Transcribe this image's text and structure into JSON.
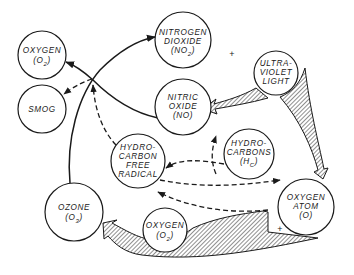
{
  "diagram": {
    "nodes": {
      "oxygen_top": {
        "line1": "OXYGEN",
        "line2": "(O",
        "sub": "2",
        "line2_end": ")"
      },
      "smog": {
        "line1": "SMOG"
      },
      "nitrogen_dioxide": {
        "line1": "NITROGEN",
        "line2": "DIOXIDE",
        "line3": "(NO",
        "sub": "2",
        "line3_end": ")"
      },
      "nitric_oxide": {
        "line1": "NITRIC",
        "line2": "OXIDE",
        "line3": "(NO)"
      },
      "ultraviolet_light": {
        "line1": "ULTRA-",
        "line2": "VIOLET",
        "line3": "LIGHT"
      },
      "hydrocarbon_free_radical": {
        "line1": "HYDRO-",
        "line2": "CARBON",
        "line3": "FREE",
        "line4": "RADICAL"
      },
      "hydrocarbons": {
        "line1": "HYDRO-",
        "line2": "CARBONS",
        "line3": "(H",
        "sub": "C",
        "line3_end": ")"
      },
      "ozone": {
        "line1": "OZONE",
        "line2": "(O",
        "sub": "3",
        "line2_end": ")"
      },
      "oxygen_atom": {
        "line1": "OXYGEN",
        "line2": "ATOM",
        "line3": "(O)"
      },
      "oxygen_bottom": {
        "line1": "OXYGEN",
        "line2": "(O",
        "sub": "2",
        "line2_end": ")"
      }
    },
    "symbols": {
      "plus_top": "+",
      "plus_bottom": "+"
    }
  }
}
